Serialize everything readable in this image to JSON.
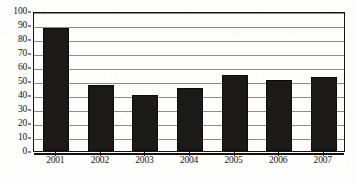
{
  "chart_data": {
    "type": "bar",
    "title": "",
    "subtitle": "",
    "xlabel": "",
    "ylabel": "",
    "categories": [
      "2001",
      "2002",
      "2003",
      "2004",
      "2005",
      "2006",
      "2007"
    ],
    "values": [
      88,
      47,
      40,
      45,
      54,
      51,
      53
    ],
    "ylim": [
      0,
      100
    ],
    "ytick_step": 10,
    "yticks": [
      "0",
      "10",
      "20",
      "30",
      "40",
      "50",
      "60",
      "70",
      "80",
      "90",
      "100"
    ],
    "grid": true,
    "grid_axis": "y",
    "legend": false,
    "legend_position": "none",
    "annotations": [],
    "colors": {
      "bar": "#1b1a18",
      "bar_border": "#0b0b0a",
      "gridline": "#8d8d87",
      "axis": "#15130f",
      "plot_background": "#fefefc",
      "figure_background": "#fdfdfb",
      "tick_label": "#17150f"
    }
  }
}
